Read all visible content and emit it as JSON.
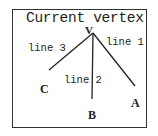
{
  "diagram": {
    "title": "Current vertex",
    "vertex": {
      "label": "V",
      "x": 93,
      "y": 33
    },
    "nodes": [
      {
        "id": "A",
        "label": "A",
        "end_x": 135,
        "end_y": 86
      },
      {
        "id": "B",
        "label": "B",
        "end_x": 92,
        "end_y": 99
      },
      {
        "id": "C",
        "label": "C",
        "end_x": 49,
        "end_y": 70
      }
    ],
    "edges": [
      {
        "label": "line 1",
        "from": "V",
        "to": "A"
      },
      {
        "label": "line 2",
        "from": "V",
        "to": "B"
      },
      {
        "label": "line 3",
        "from": "V",
        "to": "C"
      }
    ],
    "colors": {
      "stroke": "#222222",
      "frame": "#333333",
      "background": "#ffffff"
    }
  }
}
